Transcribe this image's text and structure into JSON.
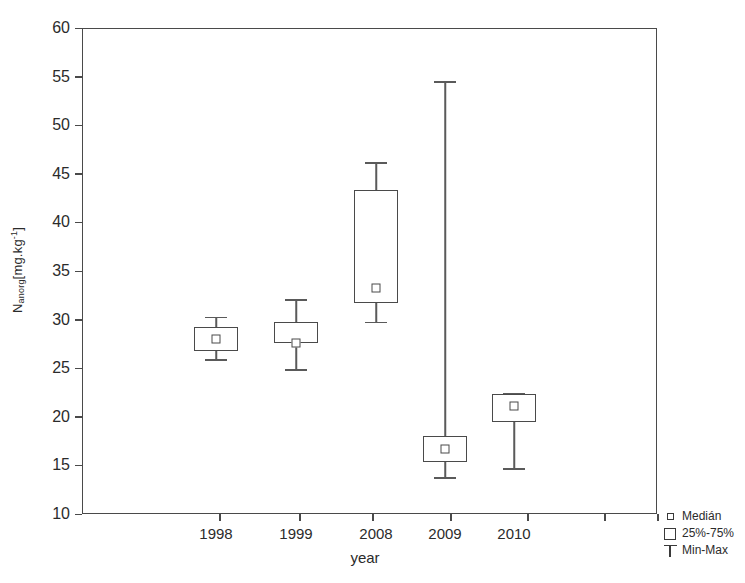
{
  "chart_data": {
    "type": "box",
    "title": "",
    "xlabel": "year",
    "ylabel": "N_anorg [mg.kg-1]",
    "ylabel_parts": {
      "symbol": "N",
      "subscript": "anorg",
      "units_open": "[mg.kg",
      "units_exp": "-1",
      "units_close": "]"
    },
    "categories": [
      "1998",
      "1999",
      "2008",
      "2009",
      "2010"
    ],
    "ylim": [
      10,
      60
    ],
    "yticks": [
      10,
      15,
      20,
      25,
      30,
      35,
      40,
      45,
      50,
      55,
      60
    ],
    "ytick_labels": [
      "10",
      "15",
      "20",
      "25",
      "30",
      "35",
      "40",
      "45",
      "50",
      "55",
      "60"
    ],
    "grid": false,
    "legend_position": "bottom-right",
    "boxes": [
      {
        "category": "1998",
        "min": 25.9,
        "q1": 26.8,
        "median": 28.0,
        "q3": 29.2,
        "max": 30.3
      },
      {
        "category": "1999",
        "min": 24.9,
        "q1": 27.6,
        "median": 27.6,
        "q3": 29.8,
        "max": 32.1
      },
      {
        "category": "2008",
        "min": 29.8,
        "q1": 31.7,
        "median": 33.3,
        "q3": 43.3,
        "max": 46.2
      },
      {
        "category": "2009",
        "min": 13.8,
        "q1": 15.3,
        "median": 16.7,
        "q3": 18.0,
        "max": 54.5
      },
      {
        "category": "2010",
        "min": 14.7,
        "q1": 19.5,
        "median": 21.1,
        "q3": 22.3,
        "max": 22.5
      }
    ],
    "legend": [
      {
        "key": "median-marker",
        "label": "Medián"
      },
      {
        "key": "box-marker",
        "label": "25%-75%"
      },
      {
        "key": "whisker-marker",
        "label": "Min-Max"
      }
    ],
    "colors": {
      "line": "#4a4a4a",
      "whisker": "#5a5a5a",
      "text": "#2b2b2b",
      "background": "#ffffff"
    }
  }
}
